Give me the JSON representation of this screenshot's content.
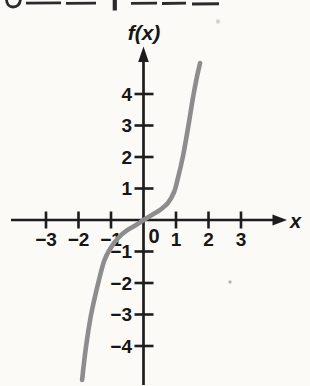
{
  "figure": {
    "y_axis_label": "f(x)",
    "x_axis_label": "x",
    "origin_label": "0"
  },
  "colors": {
    "background": "#fbfaf7",
    "axis": "#1d1d1d",
    "text": "#161616",
    "curve": "#8d8d8d"
  },
  "chart_data": {
    "type": "line",
    "title": "",
    "xlabel": "x",
    "ylabel": "f(x)",
    "grid": false,
    "legend": false,
    "xlim": [
      -4.1,
      4.4
    ],
    "ylim": [
      -5.2,
      5.5
    ],
    "x_ticks": [
      -3,
      -2,
      -1,
      1,
      2,
      3
    ],
    "x_tick_labels": [
      "−3",
      "−2",
      "−1",
      "1",
      "2",
      "3"
    ],
    "y_ticks": [
      4,
      3,
      2,
      1,
      -1,
      -2,
      -3,
      -4
    ],
    "y_tick_labels": [
      "4",
      "3",
      "2",
      "1",
      "−1",
      "−2",
      "−3",
      "−4"
    ],
    "series": [
      {
        "name": "cubic-s-curve",
        "points": [
          [
            -1.89,
            -5.08
          ],
          [
            -1.77,
            -4.03
          ],
          [
            -1.62,
            -3.05
          ],
          [
            -1.43,
            -2.16
          ],
          [
            -1.22,
            -1.33
          ],
          [
            -1.03,
            -0.92
          ],
          [
            -0.78,
            -0.57
          ],
          [
            -0.51,
            -0.33
          ],
          [
            -0.23,
            -0.16
          ],
          [
            0,
            0
          ],
          [
            0.26,
            0.16
          ],
          [
            0.51,
            0.32
          ],
          [
            0.75,
            0.54
          ],
          [
            0.94,
            0.89
          ],
          [
            1.06,
            1.33
          ],
          [
            1.22,
            2.06
          ],
          [
            1.37,
            2.92
          ],
          [
            1.52,
            3.87
          ],
          [
            1.65,
            4.57
          ],
          [
            1.74,
            4.98
          ]
        ]
      }
    ]
  }
}
